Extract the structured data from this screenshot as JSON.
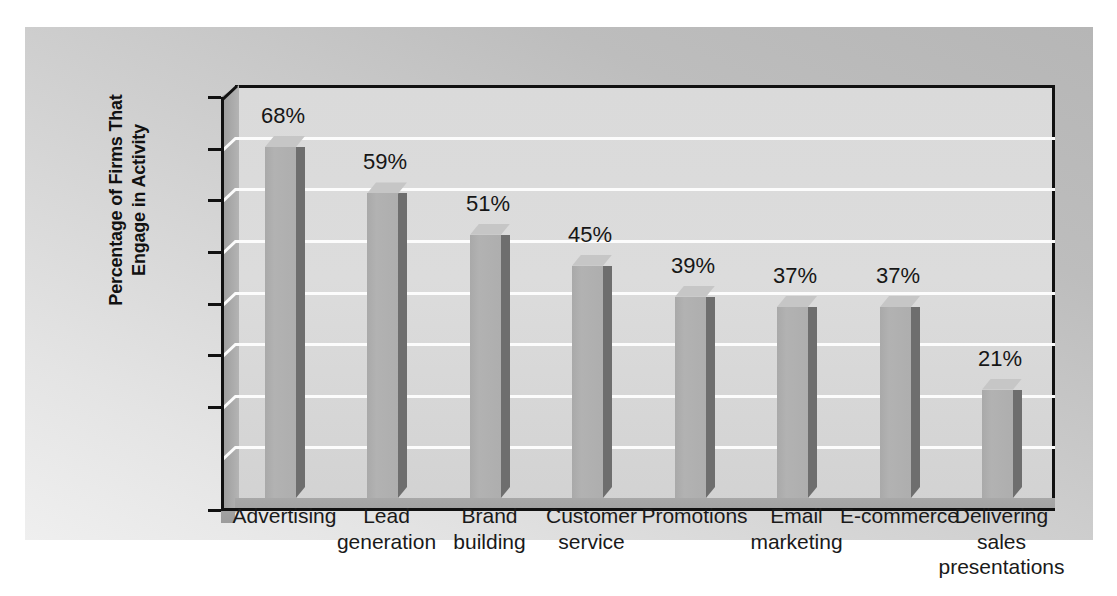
{
  "chart_data": {
    "type": "bar",
    "title": "",
    "subtitle": "",
    "xlabel": "",
    "ylabel": "Percentage of Firms That\nEngage in Activity",
    "ylabel_lines": [
      "Percentage of Firms That",
      "Engage in Activity"
    ],
    "ylim": [
      0,
      80
    ],
    "ytick_labels": [
      "80",
      "70",
      "60",
      "50",
      "40",
      "30",
      "20",
      "0"
    ],
    "ytick_values": [
      80,
      70,
      60,
      50,
      40,
      30,
      20,
      0
    ],
    "gridlines": [
      70,
      60,
      50,
      40,
      30,
      20,
      10
    ],
    "grid": true,
    "legend": "none",
    "style": "3d-column",
    "categories": [
      "Advertising",
      "Lead\ngeneration",
      "Brand\nbuilding",
      "Customer\nservice",
      "Promotions",
      "Email\nmarketing",
      "E-commerce",
      "Delivering\nsales\npresentations"
    ],
    "values": [
      68,
      59,
      51,
      45,
      39,
      37,
      37,
      21
    ],
    "data_labels": [
      "68%",
      "59%",
      "51%",
      "45%",
      "39%",
      "37%",
      "37%",
      "21%"
    ],
    "colors": {
      "bar_face": "#b2b2b2",
      "bar_side": "#6e6e6e",
      "bar_top": "#c6c6c6",
      "plot_wall": "#dcdcdc",
      "gridline": "#fcfcfc",
      "axis": "#111111",
      "outer_background": "#cfcfcf",
      "page_background": "#ffffff",
      "text": "#1a1a1a"
    }
  },
  "axis": {
    "ticks": [
      {
        "label": "80",
        "value": 80
      },
      {
        "label": "70",
        "value": 70
      },
      {
        "label": "60",
        "value": 60
      },
      {
        "label": "50",
        "value": 50
      },
      {
        "label": "40",
        "value": 40
      },
      {
        "label": "30",
        "value": 30
      },
      {
        "label": "20",
        "value": 20
      },
      {
        "label": "0",
        "value": 0
      }
    ]
  }
}
